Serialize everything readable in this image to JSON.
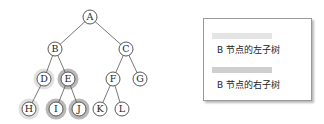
{
  "tree": {
    "nodes": [
      {
        "id": "A",
        "x": 90,
        "y": 17
      },
      {
        "id": "B",
        "x": 55,
        "y": 49
      },
      {
        "id": "C",
        "x": 126,
        "y": 49
      },
      {
        "id": "D",
        "x": 44,
        "y": 79,
        "highlight": "left"
      },
      {
        "id": "E",
        "x": 68,
        "y": 79,
        "highlight": "right"
      },
      {
        "id": "F",
        "x": 113,
        "y": 79
      },
      {
        "id": "G",
        "x": 140,
        "y": 79
      },
      {
        "id": "H",
        "x": 29,
        "y": 109,
        "highlight": "left"
      },
      {
        "id": "I",
        "x": 56,
        "y": 109,
        "highlight": "right"
      },
      {
        "id": "J",
        "x": 79,
        "y": 109,
        "highlight": "right"
      },
      {
        "id": "K",
        "x": 100,
        "y": 109
      },
      {
        "id": "L",
        "x": 122,
        "y": 109
      }
    ],
    "edges": [
      [
        "A",
        "B"
      ],
      [
        "A",
        "C"
      ],
      [
        "B",
        "D"
      ],
      [
        "B",
        "E"
      ],
      [
        "C",
        "F"
      ],
      [
        "C",
        "G"
      ],
      [
        "D",
        "H"
      ],
      [
        "E",
        "I"
      ],
      [
        "E",
        "J"
      ],
      [
        "F",
        "K"
      ],
      [
        "F",
        "L"
      ]
    ]
  },
  "legend": {
    "items": [
      {
        "label": "B 节点的左子树",
        "color": "#e4e4e4"
      },
      {
        "label": "B 节点的右子树",
        "color": "#cfcfcf"
      }
    ]
  }
}
